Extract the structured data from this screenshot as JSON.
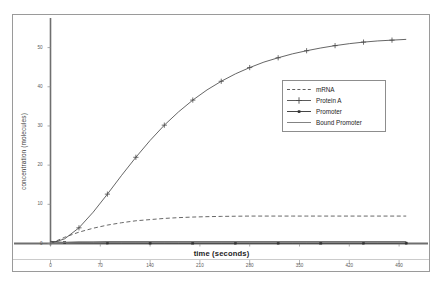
{
  "chart_data": {
    "type": "line",
    "title": "",
    "xlabel": "time (seconds)",
    "ylabel": "concentration (molecules)",
    "xlim": [
      0,
      525
    ],
    "ylim": [
      0,
      55
    ],
    "grid": false,
    "legend_position": "upper-right-inside",
    "xticks": [
      "0",
      "70",
      "140",
      "210",
      "280",
      "350",
      "420",
      "490"
    ],
    "xtick_values": [
      0,
      70,
      140,
      210,
      280,
      350,
      420,
      490
    ],
    "yticks": [
      "0",
      "10",
      "20",
      "30",
      "40",
      "50"
    ],
    "ytick_values": [
      0,
      10,
      20,
      30,
      40,
      50
    ],
    "x": [
      0,
      20,
      40,
      60,
      80,
      100,
      120,
      140,
      160,
      180,
      200,
      220,
      240,
      260,
      280,
      300,
      320,
      340,
      360,
      380,
      400,
      420,
      440,
      460,
      480,
      500
    ],
    "series": [
      {
        "name": "mRNA",
        "style": "dashed",
        "marker": "none",
        "color": "#4d4d4d",
        "values": [
          0,
          1.6,
          2.9,
          3.9,
          4.7,
          5.3,
          5.8,
          6.1,
          6.4,
          6.6,
          6.75,
          6.85,
          6.92,
          6.96,
          7.0,
          7.0,
          7.0,
          7.0,
          7.0,
          7.0,
          7.0,
          7.0,
          7.0,
          7.0,
          7.0,
          7.0
        ]
      },
      {
        "name": "Protein A",
        "style": "solid",
        "marker": "plus",
        "color": "#4a4a4a",
        "values": [
          0,
          1.2,
          4.0,
          8.0,
          12.6,
          17.4,
          22.0,
          26.3,
          30.2,
          33.6,
          36.6,
          39.2,
          41.4,
          43.3,
          44.9,
          46.3,
          47.4,
          48.4,
          49.2,
          49.9,
          50.5,
          51.0,
          51.4,
          51.7,
          51.9,
          52.1
        ]
      },
      {
        "name": "Promoter",
        "style": "solid",
        "marker": "square",
        "color": "#303030",
        "values": [
          0.55,
          0.25,
          0.18,
          0.15,
          0.13,
          0.12,
          0.12,
          0.11,
          0.11,
          0.1,
          0.1,
          0.1,
          0.1,
          0.1,
          0.1,
          0.1,
          0.1,
          0.1,
          0.1,
          0.1,
          0.1,
          0.1,
          0.1,
          0.1,
          0.1,
          0.1
        ]
      },
      {
        "name": "Bound Promoter",
        "style": "solid",
        "marker": "none",
        "color": "#757575",
        "values": [
          0,
          0.3,
          0.4,
          0.45,
          0.48,
          0.5,
          0.5,
          0.5,
          0.5,
          0.5,
          0.5,
          0.5,
          0.5,
          0.5,
          0.5,
          0.5,
          0.5,
          0.5,
          0.5,
          0.5,
          0.5,
          0.5,
          0.5,
          0.5,
          0.5,
          0.5
        ]
      }
    ]
  },
  "legend": {
    "entries": [
      {
        "label": "mRNA"
      },
      {
        "label": "Protein A"
      },
      {
        "label": "Promoter"
      },
      {
        "label": "Bound Promoter"
      }
    ]
  },
  "colors": {
    "frame": "#9a9a9a",
    "axis": "#6f6f6f",
    "background": "#ffffff"
  }
}
